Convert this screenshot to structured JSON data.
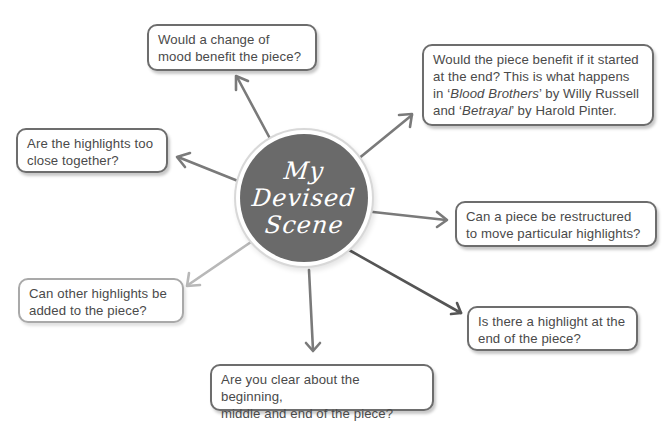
{
  "hub": {
    "title_lines": [
      "My",
      "Devised",
      "Scene"
    ],
    "fill_color": "#6a6a6a"
  },
  "boxes": {
    "top": {
      "lines": [
        "Would a change of",
        "mood benefit the piece?"
      ]
    },
    "top_right": {
      "line1": "Would the piece benefit if it started",
      "line2": "at the end? This is what happens",
      "line3_prefix": "in ‘",
      "line3_title": "Blood Brothers",
      "line3_suffix": "’ by Willy Russell",
      "line4_prefix": "and ‘",
      "line4_title": "Betrayal",
      "line4_suffix": "’ by Harold Pinter."
    },
    "left": {
      "lines": [
        "Are the highlights too",
        "close together?"
      ]
    },
    "right": {
      "lines": [
        "Can a piece be restructured",
        "to move particular highlights?"
      ]
    },
    "bottom_left": {
      "lines": [
        "Can other highlights be",
        "added to the piece?"
      ]
    },
    "bottom_right": {
      "lines": [
        "Is there a highlight at the",
        "end of the piece?"
      ]
    },
    "bottom": {
      "lines": [
        "Are you clear about the beginning,",
        "middle and end of the piece?"
      ]
    }
  },
  "colors": {
    "arrow_default": "#7a7a7a",
    "arrow_light": "#b8b8b8",
    "arrow_dark": "#555555",
    "box_border": "#6d6d6d",
    "box_border_light": "#a9a9a9",
    "text": "#4a4a4a"
  }
}
